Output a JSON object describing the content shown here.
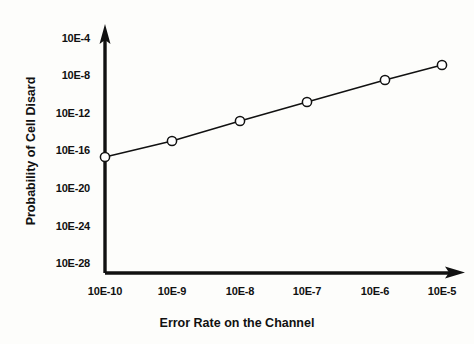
{
  "chart_data": {
    "type": "line",
    "title": "",
    "xlabel": "Error Rate on the Channel",
    "ylabel": "Probability of Cell Disard",
    "x_tick_labels": [
      "10E-10",
      "10E-9",
      "10E-8",
      "10E-7",
      "10E-6",
      "10E-5"
    ],
    "y_tick_labels": [
      "10E-4",
      "10E-8",
      "10E-12",
      "10E-16",
      "10E-20",
      "10E-24",
      "10E-28"
    ],
    "x": [
      1e-10,
      1e-09,
      1e-08,
      1e-07,
      1e-06,
      1e-05
    ],
    "x_exponents": [
      -10,
      -9,
      -8,
      -7,
      -6,
      -5
    ],
    "y_exponents": [
      -17.0,
      -15.3,
      -13.2,
      -11.2,
      -8.6,
      -7.0
    ],
    "values": [
      1e-17,
      5e-16,
      6e-14,
      6e-12,
      2.5e-09,
      1e-07
    ],
    "marker": "open-circle",
    "marker_fill": "#ffffff",
    "marker_stroke": "#111111",
    "line_color": "#111111",
    "grid": false,
    "legend": null,
    "xlim_exponents": [
      -10.4,
      -4.6
    ],
    "ylim_exponents": [
      -29.5,
      -2.5
    ],
    "axis_style": "arrow",
    "background": "#fdfdfb"
  },
  "axes": {
    "y_ticks": [
      {
        "label": "10E-4",
        "top": 32
      },
      {
        "label": "10E-8",
        "top": 69
      },
      {
        "label": "10E-12",
        "top": 107
      },
      {
        "label": "10E-16",
        "top": 144
      },
      {
        "label": "10E-20",
        "top": 182
      },
      {
        "label": "10E-24",
        "top": 220
      },
      {
        "label": "10E-28",
        "top": 257
      }
    ],
    "x_ticks": [
      {
        "label": "10E-10",
        "left": 70
      },
      {
        "label": "10E-9",
        "left": 137
      },
      {
        "label": "10E-8",
        "left": 205
      },
      {
        "label": "10E-7",
        "left": 272
      },
      {
        "label": "10E-6",
        "left": 340
      },
      {
        "label": "10E-5",
        "left": 407
      }
    ]
  },
  "series_points": [
    {
      "cx": 105,
      "cy": 157,
      "x_label": "10E-10",
      "y_value": "10E-17"
    },
    {
      "cx": 172,
      "cy": 141,
      "x_label": "10E-9",
      "y_value": "10E-15.3"
    },
    {
      "cx": 240,
      "cy": 121,
      "x_label": "10E-8",
      "y_value": "10E-13.2"
    },
    {
      "cx": 307,
      "cy": 102,
      "x_label": "10E-7",
      "y_value": "10E-11.2"
    },
    {
      "cx": 385,
      "cy": 80,
      "x_label": "10E-6",
      "y_value": "10E-8.6"
    },
    {
      "cx": 442,
      "cy": 65,
      "x_label": "10E-5",
      "y_value": "10E-7"
    }
  ]
}
